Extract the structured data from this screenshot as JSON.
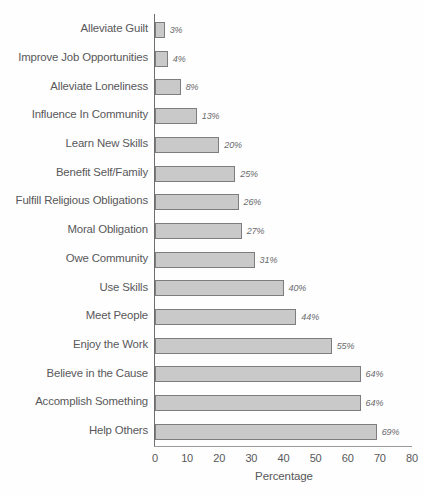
{
  "chart_data": {
    "type": "bar",
    "orientation": "horizontal",
    "title": "",
    "subtitle": "",
    "xlabel": "Percentage",
    "ylabel": "",
    "xlim": [
      0,
      80
    ],
    "xticks": [
      0,
      10,
      20,
      30,
      40,
      50,
      60,
      70,
      80
    ],
    "xtick_labels": [
      "0",
      "10",
      "20",
      "30",
      "40",
      "50",
      "60",
      "70",
      "80"
    ],
    "grid": false,
    "legend": false,
    "value_label_suffix": "%",
    "categories": [
      "Alleviate Guilt",
      "Improve Job Opportunities",
      "Alleviate Loneliness",
      "Influence In Community",
      "Learn New Skills",
      "Benefit Self/Family",
      "Fulfill Religious Obligations",
      "Moral Obligation",
      "Owe Community",
      "Use Skills",
      "Meet People",
      "Enjoy the Work",
      "Believe in the Cause",
      "Accomplish Something",
      "Help Others"
    ],
    "values": [
      3,
      4,
      8,
      13,
      20,
      25,
      26,
      27,
      31,
      40,
      44,
      55,
      64,
      64,
      69
    ],
    "value_labels": [
      "3%",
      "4%",
      "8%",
      "13%",
      "20%",
      "25%",
      "26%",
      "27%",
      "31%",
      "40%",
      "44%",
      "55%",
      "64%",
      "64%",
      "69%"
    ],
    "colors": {
      "bar_fill": "#c9c9c9",
      "bar_border": "#7d7d7f",
      "axis": "#6e6e70",
      "text": "#58585a",
      "value_text": "#6a6a6c",
      "background": "#fefefe"
    }
  },
  "axis": {
    "x_title": "Percentage"
  }
}
